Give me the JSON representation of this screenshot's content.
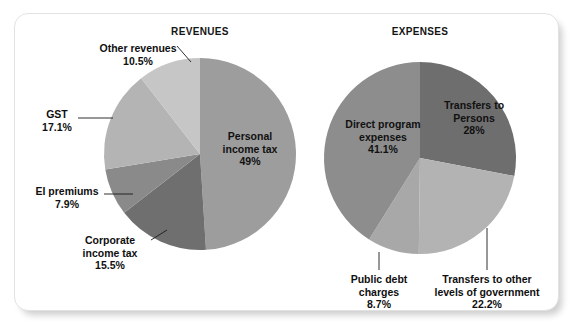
{
  "figure": {
    "panels": [
      {
        "id": "revenues",
        "title": "REVENUES"
      },
      {
        "id": "expenses",
        "title": "EXPENSES"
      }
    ]
  },
  "revenues": {
    "title": "REVENUES",
    "slices": [
      {
        "name": "personal-income-tax",
        "label": "Personal\nincome tax",
        "label_line_1": "Personal",
        "label_line_2": "income tax",
        "value": "49%",
        "pct": 49.0,
        "color": "#9d9d9d",
        "placement": "inside"
      },
      {
        "name": "corporate-income-tax",
        "label": "Corporate\nincome tax",
        "label_line_1": "Corporate",
        "label_line_2": "income tax",
        "value": "15.5%",
        "pct": 15.5,
        "color": "#6f6f6f",
        "placement": "outside"
      },
      {
        "name": "ei-premiums",
        "label": "EI premiums",
        "label_line_1": "EI premiums",
        "label_line_2": "",
        "value": "7.9%",
        "pct": 7.9,
        "color": "#8a8a8a",
        "placement": "outside"
      },
      {
        "name": "gst",
        "label": "GST",
        "label_line_1": "GST",
        "label_line_2": "",
        "value": "17.1%",
        "pct": 17.1,
        "color": "#b4b4b4",
        "placement": "outside"
      },
      {
        "name": "other-revenues",
        "label": "Other revenues",
        "label_line_1": "Other revenues",
        "label_line_2": "",
        "value": "10.5%",
        "pct": 10.5,
        "color": "#c6c6c6",
        "placement": "outside"
      }
    ]
  },
  "expenses": {
    "title": "EXPENSES",
    "slices": [
      {
        "name": "transfers-to-persons",
        "label": "Transfers to\nPersons",
        "label_line_1": "Transfers to",
        "label_line_2": "Persons",
        "value": "28%",
        "pct": 28.0,
        "color": "#6e6e6e",
        "placement": "inside"
      },
      {
        "name": "transfers-to-other-levels-of-government",
        "label": "Transfers to other\nlevels of government",
        "label_line_1": "Transfers to other",
        "label_line_2": "levels of government",
        "value": "22.2%",
        "pct": 22.2,
        "color": "#b3b3b3",
        "placement": "outside"
      },
      {
        "name": "public-debt-charges",
        "label": "Public debt\ncharges",
        "label_line_1": "Public debt",
        "label_line_2": "charges",
        "value": "8.7%",
        "pct": 8.7,
        "color": "#a8a8a8",
        "placement": "outside"
      },
      {
        "name": "direct-program-expenses",
        "label": "Direct program\nexpenses",
        "label_line_1": "Direct program",
        "label_line_2": "expenses",
        "value": "41.1%",
        "pct": 41.1,
        "color": "#8d8d8d",
        "placement": "inside"
      }
    ]
  },
  "chart_data": [
    {
      "type": "pie",
      "title": "REVENUES",
      "categories": [
        "Personal income tax",
        "Corporate income tax",
        "EI premiums",
        "GST",
        "Other revenues"
      ],
      "values": [
        49.0,
        15.5,
        7.9,
        17.1,
        10.5
      ],
      "value_labels": [
        "49%",
        "15.5%",
        "7.9%",
        "17.1%",
        "10.5%"
      ],
      "units": "percent",
      "colors": [
        "#9d9d9d",
        "#6f6f6f",
        "#8a8a8a",
        "#b4b4b4",
        "#c6c6c6"
      ],
      "start_angle_deg": 0,
      "direction": "clockwise",
      "legend": "none",
      "labels_position": "mixed: 'Personal income tax 49%' inside slice, others outside with leader lines",
      "grid": false,
      "xlabel": "",
      "ylabel": ""
    },
    {
      "type": "pie",
      "title": "EXPENSES",
      "categories": [
        "Transfers to Persons",
        "Transfers to other levels of government",
        "Public debt charges",
        "Direct program expenses"
      ],
      "values": [
        28.0,
        22.2,
        8.7,
        41.1
      ],
      "value_labels": [
        "28%",
        "22.2%",
        "8.7%",
        "41.1%"
      ],
      "units": "percent",
      "colors": [
        "#6e6e6e",
        "#b3b3b3",
        "#a8a8a8",
        "#8d8d8d"
      ],
      "start_angle_deg": 0,
      "direction": "clockwise",
      "legend": "none",
      "labels_position": "mixed: 'Transfers to Persons 28%' and 'Direct program expenses 41.1%' inside slices, others outside with leader lines",
      "grid": false,
      "xlabel": "",
      "ylabel": ""
    }
  ]
}
